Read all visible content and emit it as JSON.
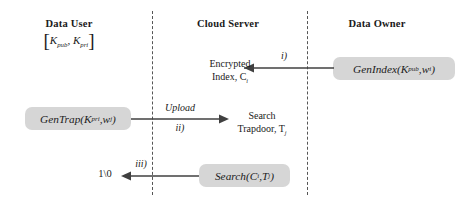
{
  "diagram": {
    "columns": [
      {
        "id": "data-user",
        "label": "Data User"
      },
      {
        "id": "cloud-server",
        "label": "Cloud Server"
      },
      {
        "id": "data-owner",
        "label": "Data Owner"
      }
    ],
    "key_pair": {
      "open_bracket": "[",
      "close_bracket": "]",
      "k_pub_base": "K",
      "k_pub_sub": "pub",
      "separator": ", ",
      "k_pri_base": "K",
      "k_pri_sub": "pri"
    },
    "boxes": [
      {
        "id": "genindex",
        "name": "GenIndex",
        "args_open": "(",
        "arg1_base": "K",
        "arg1_sub": "pub",
        "arg_sep": ", ",
        "arg2_base": "w",
        "arg2_sub": "i",
        "args_close": ")",
        "fill": "#d6d6d6"
      },
      {
        "id": "gentrap",
        "name": "GenTrap",
        "args_open": "(",
        "arg1_base": "K",
        "arg1_sub": "pri",
        "arg_sep": ", ",
        "arg2_base": "w",
        "arg2_sub": "j",
        "args_close": ")",
        "fill": "#d6d6d6"
      },
      {
        "id": "search",
        "name": "Search",
        "args_open": "(",
        "arg1_base": "C",
        "arg1_sub": "i",
        "arg_sep": ", ",
        "arg2_base": "T",
        "arg2_sub": "j",
        "args_close": ")",
        "fill": "#d6d6d6"
      }
    ],
    "notes": {
      "encrypted_index_line1": "Encrypted",
      "encrypted_index_line2_base": "Index, C",
      "encrypted_index_line2_sub": "i",
      "search_trapdoor_line1": "Search",
      "search_trapdoor_line2_base": "Trapdoor, T",
      "search_trapdoor_line2_sub": "j",
      "result": "1\\0"
    },
    "steps": [
      {
        "id": "i",
        "label": "i)",
        "direction": "left",
        "extra_label": ""
      },
      {
        "id": "ii",
        "label": "ii)",
        "direction": "right",
        "extra_label": "Upload"
      },
      {
        "id": "iii",
        "label": "iii)",
        "direction": "left",
        "extra_label": ""
      }
    ],
    "colors": {
      "box_fill": "#d6d6d6",
      "arrow": "#404040",
      "divider": "#555555",
      "text": "#1a1a1a",
      "background": "#ffffff"
    }
  }
}
